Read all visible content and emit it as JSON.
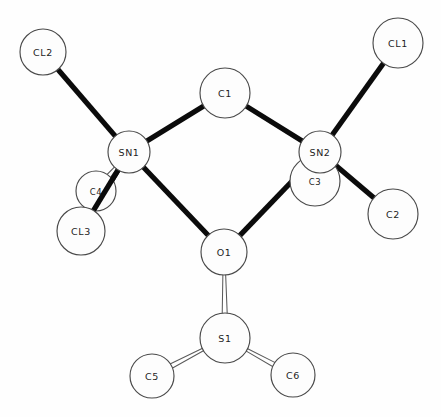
{
  "figure": {
    "background_color": "#fefefe",
    "outline_color": "#4a4a4a",
    "bond_color": "#0b0b0b",
    "open_bond_fill": "#ffffff",
    "width": 441,
    "height": 417
  },
  "chart_data": {
    "type": "diagram",
    "xlabel": "",
    "ylabel": "",
    "xlim": [
      0,
      441
    ],
    "ylim": [
      0,
      417
    ],
    "grid": false,
    "legend": "none",
    "atoms": [
      {
        "id": "CL2",
        "label": "CL2",
        "x": 43,
        "y": 52,
        "r": 23,
        "label_size": "normal"
      },
      {
        "id": "CL1",
        "label": "CL1",
        "x": 398,
        "y": 43,
        "r": 25,
        "label_size": "normal"
      },
      {
        "id": "C1",
        "label": "C1",
        "x": 225,
        "y": 93,
        "r": 25,
        "label_size": "normal"
      },
      {
        "id": "SN1",
        "label": "SN1",
        "x": 129,
        "y": 152,
        "r": 21,
        "label_size": "normal"
      },
      {
        "id": "SN2",
        "label": "SN2",
        "x": 320,
        "y": 152,
        "r": 21,
        "label_size": "normal"
      },
      {
        "id": "C4",
        "label": "C4",
        "x": 96,
        "y": 191,
        "r": 20,
        "label_size": "small"
      },
      {
        "id": "C3",
        "label": "C3",
        "x": 315,
        "y": 181,
        "r": 25,
        "label_size": "small"
      },
      {
        "id": "CL3",
        "label": "CL3",
        "x": 81,
        "y": 231,
        "r": 24,
        "label_size": "normal"
      },
      {
        "id": "C2",
        "label": "C2",
        "x": 393,
        "y": 214,
        "r": 25,
        "label_size": "normal"
      },
      {
        "id": "O1",
        "label": "O1",
        "x": 224,
        "y": 252,
        "r": 23,
        "label_size": "normal"
      },
      {
        "id": "S1",
        "label": "S1",
        "x": 225,
        "y": 338,
        "r": 25,
        "label_size": "normal"
      },
      {
        "id": "C5",
        "label": "C5",
        "x": 152,
        "y": 376,
        "r": 22,
        "label_size": "normal"
      },
      {
        "id": "C6",
        "label": "C6",
        "x": 293,
        "y": 375,
        "r": 22,
        "label_size": "normal"
      }
    ],
    "bonds": [
      {
        "from": "CL2",
        "to": "SN1",
        "style": "solid",
        "width": 5.2
      },
      {
        "from": "CL1",
        "to": "SN2",
        "style": "solid",
        "width": 5.2
      },
      {
        "from": "SN1",
        "to": "C1",
        "style": "solid",
        "width": 5.2
      },
      {
        "from": "C1",
        "to": "SN2",
        "style": "solid",
        "width": 5.2
      },
      {
        "from": "SN1",
        "to": "O1",
        "style": "solid",
        "width": 5.2
      },
      {
        "from": "O1",
        "to": "SN2",
        "style": "solid",
        "width": 5.2
      },
      {
        "from": "SN2",
        "to": "C2",
        "style": "solid",
        "width": 5.2
      },
      {
        "from": "SN1",
        "to": "CL3",
        "style": "solid",
        "width": 5.2
      },
      {
        "from": "SN1",
        "to": "C4",
        "style": "open",
        "width": 4.6
      },
      {
        "from": "SN2",
        "to": "C3",
        "style": "open",
        "width": 4.6
      },
      {
        "from": "O1",
        "to": "S1",
        "style": "open",
        "width": 5.0
      },
      {
        "from": "S1",
        "to": "C5",
        "style": "open",
        "width": 4.8
      },
      {
        "from": "S1",
        "to": "C6",
        "style": "open",
        "width": 4.8
      }
    ]
  }
}
